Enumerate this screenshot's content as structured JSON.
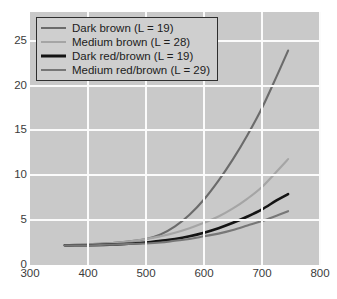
{
  "chart_data": {
    "type": "line",
    "title": "",
    "xlabel": "",
    "ylabel": "",
    "xlim": [
      300,
      800
    ],
    "ylim": [
      0,
      28.2
    ],
    "grid": true,
    "legend_position": "top-left",
    "x_ticks": [
      300,
      400,
      500,
      600,
      700,
      800
    ],
    "y_ticks": [
      0,
      5,
      10,
      15,
      20,
      25
    ],
    "background_color": "#c9c9c9",
    "gridline_color": "#fbfbfb",
    "series": [
      {
        "name": "Dark brown (L = 19)",
        "color": "#6b6b6b",
        "width": 2.1,
        "x": [
          360,
          400,
          450,
          500,
          525,
          550,
          575,
          600,
          625,
          650,
          675,
          700,
          725,
          745
        ],
        "values": [
          2.2,
          2.3,
          2.5,
          2.9,
          3.4,
          4.3,
          5.6,
          7.3,
          9.4,
          11.8,
          14.5,
          17.5,
          21.0,
          23.9
        ]
      },
      {
        "name": "Medium brown (L = 28)",
        "color": "#a5a5a5",
        "width": 2.1,
        "x": [
          360,
          400,
          450,
          500,
          525,
          550,
          575,
          600,
          625,
          650,
          675,
          700,
          725,
          745
        ],
        "values": [
          2.2,
          2.3,
          2.5,
          2.9,
          3.2,
          3.6,
          4.1,
          4.7,
          5.4,
          6.3,
          7.4,
          8.7,
          10.4,
          11.8
        ]
      },
      {
        "name": "Dark red/brown (L = 19)",
        "color": "#141414",
        "width": 2.6,
        "x": [
          360,
          400,
          450,
          500,
          525,
          550,
          575,
          600,
          625,
          650,
          675,
          700,
          725,
          745
        ],
        "values": [
          2.2,
          2.2,
          2.3,
          2.5,
          2.7,
          2.9,
          3.2,
          3.6,
          4.1,
          4.7,
          5.4,
          6.2,
          7.2,
          7.9
        ]
      },
      {
        "name": "Medium red/brown (L = 29)",
        "color": "#777777",
        "width": 2.1,
        "x": [
          360,
          400,
          450,
          500,
          525,
          550,
          575,
          600,
          625,
          650,
          675,
          700,
          725,
          745
        ],
        "values": [
          2.2,
          2.2,
          2.3,
          2.4,
          2.5,
          2.7,
          2.9,
          3.2,
          3.5,
          3.9,
          4.4,
          4.9,
          5.5,
          6.0
        ]
      }
    ]
  },
  "legend": {
    "items": [
      {
        "label": "Dark brown (L = 19)",
        "color": "#6b6b6b",
        "thickness": "2px"
      },
      {
        "label": "Medium brown (L = 28)",
        "color": "#a5a5a5",
        "thickness": "2px"
      },
      {
        "label": "Dark red/brown (L = 19)",
        "color": "#141414",
        "thickness": "3px"
      },
      {
        "label": "Medium red/brown (L = 29)",
        "color": "#777777",
        "thickness": "2px"
      }
    ]
  }
}
